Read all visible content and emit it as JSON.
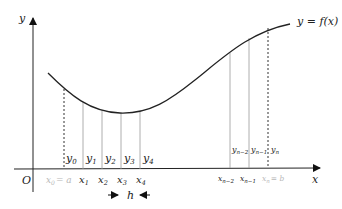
{
  "diagram": {
    "curve_label": "y = f(x)",
    "axes": {
      "x_label": "x",
      "y_label": "y",
      "origin_label": "O"
    },
    "ordinate_labels": {
      "y0": "y",
      "y0_sub": "0",
      "y1": "y",
      "y1_sub": "1",
      "y2": "y",
      "y2_sub": "2",
      "y3": "y",
      "y3_sub": "3",
      "y4": "y",
      "y4_sub": "4",
      "yn2": "y",
      "yn2_sub": "n−2",
      "yn1": "y",
      "yn1_sub": "n−1",
      "yn": "y",
      "yn_sub": "n"
    },
    "abscissa_labels": {
      "x0": "x",
      "x0_sub": "0",
      "x0_eq": "= a",
      "x1": "x",
      "x1_sub": "1",
      "x2": "x",
      "x2_sub": "2",
      "x3": "x",
      "x3_sub": "3",
      "x4": "x",
      "x4_sub": "4",
      "xn2": "x",
      "xn2_sub": "n−2",
      "xn1": "x",
      "xn1_sub": "n−1",
      "xn": "x",
      "xn_sub": "n",
      "xn_eq": "= b"
    },
    "step_label": "h",
    "colors": {
      "curve": "#222222",
      "axis": "#222222",
      "ordinate": "#9a9a9a",
      "endpoint_label": "#b8b8b8"
    }
  }
}
